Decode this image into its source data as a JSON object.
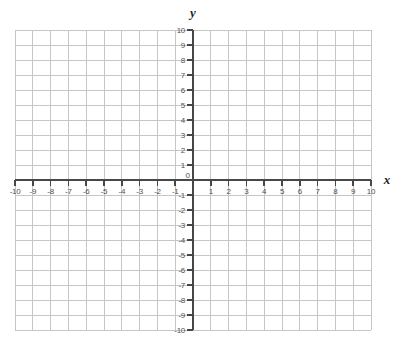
{
  "chart_data": {
    "type": "scatter",
    "title": "",
    "xlabel": "x",
    "ylabel": "y",
    "origin_label": "0",
    "xlim": [
      -10,
      10
    ],
    "ylim": [
      -10,
      10
    ],
    "grid": true,
    "grid_step": 1,
    "series": [],
    "x_tick_labels": [
      "-10",
      "-9",
      "-8",
      "-7",
      "-6",
      "-5",
      "-4",
      "-3",
      "-2",
      "-1",
      "1",
      "2",
      "3",
      "4",
      "5",
      "6",
      "7",
      "8",
      "9",
      "10"
    ],
    "x_tick_values": [
      -10,
      -9,
      -8,
      -7,
      -6,
      -5,
      -4,
      -3,
      -2,
      -1,
      1,
      2,
      3,
      4,
      5,
      6,
      7,
      8,
      9,
      10
    ],
    "y_tick_labels": [
      "10",
      "9",
      "8",
      "7",
      "6",
      "5",
      "4",
      "3",
      "2",
      "1",
      "-1",
      "-2",
      "-3",
      "-4",
      "-5",
      "-6",
      "-7",
      "-8",
      "-9",
      "-10"
    ],
    "y_tick_values": [
      10,
      9,
      8,
      7,
      6,
      5,
      4,
      3,
      2,
      1,
      -1,
      -2,
      -3,
      -4,
      -5,
      -6,
      -7,
      -8,
      -9,
      -10
    ]
  },
  "colors": {
    "background": "#ffffff",
    "grid_line": "#c6c6c6",
    "axis_line": "#474747",
    "tick_label": "#4f4f4f",
    "axis_letter": "#1f1f1f"
  }
}
